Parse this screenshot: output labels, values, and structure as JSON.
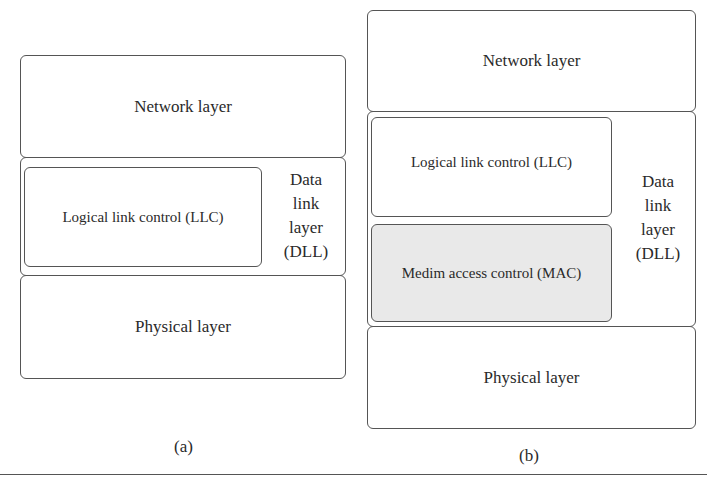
{
  "figure_a": {
    "caption": "(a)",
    "network_layer": "Network layer",
    "llc": "Logical link control (LLC)",
    "dll_label": [
      "Data",
      "link",
      "layer",
      "(DLL)"
    ],
    "physical_layer": "Physical layer"
  },
  "figure_b": {
    "caption": "(b)",
    "network_layer": "Network layer",
    "llc": "Logical link control (LLC)",
    "mac": "Medim access control (MAC)",
    "dll_label": [
      "Data",
      "link",
      "layer",
      "(DLL)"
    ],
    "physical_layer": "Physical layer"
  },
  "colors": {
    "border": "#555555",
    "mac_fill": "#e9e9e9",
    "text": "#2a2a2a"
  }
}
